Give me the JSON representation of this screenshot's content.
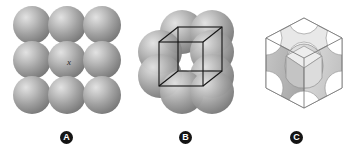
{
  "figure": {
    "background_color": "#ffffff",
    "width": 353,
    "height": 155
  },
  "panels": [
    {
      "id": "A",
      "badge_label": "A",
      "title": "Sphere array",
      "kind": "sphere-grid",
      "grid": {
        "rows": 3,
        "cols": 3
      },
      "annotation": {
        "text": "x",
        "style": "italic"
      },
      "sphere_style": {
        "highlight_color": "#e2e2e2",
        "mid_color": "#a2a2a2",
        "shadow_color": "#6a6a6a"
      }
    },
    {
      "id": "B",
      "badge_label": "B",
      "title": "Spheres with unit cell outline",
      "kind": "sphere-cluster-with-wireframe",
      "sphere_count": 8,
      "wireframe": {
        "shape": "cube",
        "projection": "oblique",
        "line_color": "#1a1a1a",
        "line_width": 1.1
      }
    },
    {
      "id": "C",
      "badge_label": "C",
      "title": "Cut unit cell",
      "kind": "cut-unit-cell",
      "face_colors": {
        "top": "#e6e6e6",
        "left": "#b9b9b9",
        "right": "#d2d2d2",
        "interior": "#9a9a9a",
        "outline": "#7a7a7a"
      }
    }
  ],
  "colors": {
    "badge_fill": "#141414",
    "badge_text": "#ffffff",
    "annotation_text": "#2b2b2b"
  }
}
